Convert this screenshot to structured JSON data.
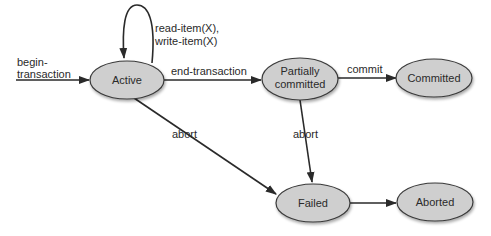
{
  "diagram": {
    "type": "state-transition",
    "nodes": {
      "active": "Active",
      "partially_committed_line1": "Partially",
      "partially_committed_line2": "committed",
      "committed": "Committed",
      "failed": "Failed",
      "aborted": "Aborted"
    },
    "edges": {
      "begin_line1": "begin-",
      "begin_line2": "transaction",
      "self_loop_line1": "read-item(X),",
      "self_loop_line2": "write-item(X)",
      "end_transaction": "end-transaction",
      "commit": "commit",
      "abort_from_active": "abort",
      "abort_from_partial": "abort"
    },
    "colors": {
      "node_fill": "#cfcfcf",
      "stroke": "#2a2a2a"
    }
  }
}
